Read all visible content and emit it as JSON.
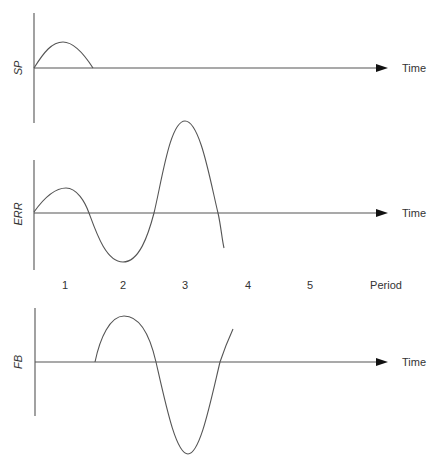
{
  "diagram": {
    "plots": [
      {
        "id": "sp",
        "ylabel": "SP",
        "xlabel": "Time",
        "axis": {
          "x": 34,
          "y_top": 13,
          "y_bottom": 123,
          "baseline_y": 68,
          "x_end": 387
        },
        "curve_path": "M34,68 C44,52 52,42 63,42 C74,42 84,54 93,68"
      },
      {
        "id": "err",
        "ylabel": "ERR",
        "xlabel": "Time",
        "axis": {
          "x": 34,
          "y_top": 160,
          "y_bottom": 270,
          "baseline_y": 213,
          "x_end": 387
        },
        "curve_path": "M34,212 C44,198 55,188 66,188 C77,188 85,202 89,213 C96,232 106,262 123,262 C139,262 148,236 154,213 C162,180 170,121 185,121 C200,121 210,180 218,213 C221,226 222,240 224,248"
      },
      {
        "id": "fb",
        "ylabel": "FB",
        "xlabel": "Time",
        "axis": {
          "x": 35,
          "y_top": 308,
          "y_bottom": 416,
          "baseline_y": 362,
          "x_end": 387
        },
        "curve_path": "M95,362 C100,338 110,316 124,316 C140,316 150,336 156,362 C166,406 176,454 188,454 C200,454 210,404 220,362 C224,350 228,340 233,329"
      }
    ],
    "period_axis": {
      "label": "Period",
      "ticks": [
        {
          "label": "1",
          "x": 65
        },
        {
          "label": "2",
          "x": 123
        },
        {
          "label": "3",
          "x": 185
        },
        {
          "label": "4",
          "x": 248
        },
        {
          "label": "5",
          "x": 310
        }
      ]
    },
    "colors": {
      "line": "#555555",
      "arrow": "#111111",
      "text": "#333333"
    }
  }
}
